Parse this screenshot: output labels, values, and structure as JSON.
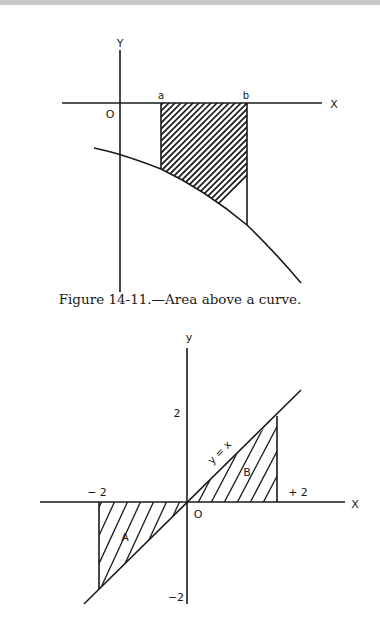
{
  "figure1": {
    "labels": {
      "y_axis": "Y",
      "x_axis": "X",
      "origin": "O",
      "a": "a",
      "b": "b"
    },
    "caption": "Figure 14-11.—Area above a curve.",
    "description": "Shaded region between x-axis and a decreasing concave curve below it, bounded by x=a and x=b"
  },
  "figure2": {
    "labels": {
      "y_axis": "y",
      "x_axis": "X",
      "origin": "O",
      "x_neg": "− 2",
      "x_pos": "+ 2",
      "y_pos": "2",
      "y_neg": "−2",
      "line": "y = x",
      "region_a": "A",
      "region_b": "B"
    },
    "description": "Line y = x with shaded triangles A (x from −2 to 0, below axis) and B (x from 0 to +2, above axis)"
  },
  "colors": {
    "ink": "#1a1a1a",
    "background": "#ffffff",
    "top_bar": "#c9c9c9"
  }
}
